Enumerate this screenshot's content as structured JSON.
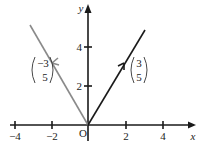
{
  "diagram": {
    "type": "vector-diagram",
    "axes": {
      "x_label": "x",
      "y_label": "y",
      "origin_label": "O",
      "x_ticks": [
        {
          "value": -4,
          "label": "−4"
        },
        {
          "value": -2,
          "label": "−2"
        },
        {
          "value": 2,
          "label": "2"
        },
        {
          "value": 4,
          "label": "4"
        }
      ],
      "y_ticks": [
        {
          "value": 2,
          "label": "2"
        },
        {
          "value": 4,
          "label": "4"
        }
      ]
    },
    "vectors": [
      {
        "name": "left-vector",
        "x": -3,
        "y": 5,
        "top": "−3",
        "bottom": "5",
        "color": "#8a8a8a"
      },
      {
        "name": "right-vector",
        "x": 3,
        "y": 5,
        "top": "3",
        "bottom": "5",
        "color": "#1a1a1a"
      }
    ]
  }
}
